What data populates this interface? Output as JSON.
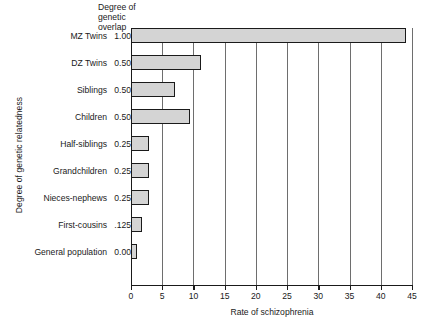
{
  "chart_data": {
    "type": "bar",
    "orientation": "horizontal",
    "title": "",
    "xlabel": "Rate of schizophrenia",
    "ylabel": "Degree of genetic relatedness",
    "xlim": [
      0,
      45
    ],
    "xticks": [
      "0",
      "5",
      "10",
      "15",
      "20",
      "25",
      "30",
      "35",
      "40",
      "45"
    ],
    "grid": "vertical",
    "legend": "none",
    "value_column_header": "Degree of\ngenetic\noverlap",
    "value_column_header_lines": [
      "Degree of",
      "genetic",
      "overlap"
    ],
    "categories": [
      "MZ Twins",
      "DZ Twins",
      "Siblings",
      "Children",
      "Half-siblings",
      "Grandchildren",
      "Nieces-nephews",
      "First-cousins",
      "General population"
    ],
    "genetic_overlap": [
      "1.00",
      "0.50",
      "0.50",
      "0.50",
      "0.25",
      "0.25",
      "0.25",
      ".125",
      "0.00"
    ],
    "values": [
      44,
      11.2,
      7,
      9.5,
      2.9,
      2.9,
      2.9,
      1.8,
      0.9
    ],
    "bar_fill": "#d4d4d4",
    "bar_stroke": "#1a1a1a",
    "gridline_color": "#6e6e6e",
    "background": "#ffffff"
  }
}
